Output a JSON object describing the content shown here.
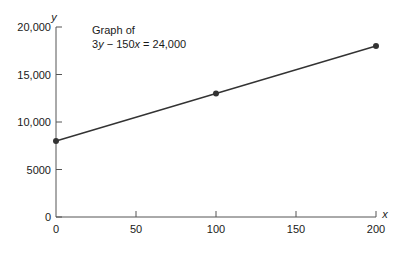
{
  "chart_data": {
    "type": "line",
    "title": "Graph of 3y − 150x = 24,000",
    "annotation": {
      "line1": "Graph of",
      "equation_parts": [
        "3",
        "y",
        " − 150",
        "x",
        " = 24,000"
      ]
    },
    "xlabel": "x",
    "ylabel": "y",
    "xlim": [
      0,
      200
    ],
    "ylim": [
      0,
      20000
    ],
    "x_ticks": [
      0,
      50,
      100,
      150,
      200
    ],
    "x_tick_labels": [
      "0",
      "50",
      "100",
      "150",
      "200"
    ],
    "y_ticks": [
      0,
      5000,
      10000,
      15000,
      20000
    ],
    "y_tick_labels": [
      "0",
      "5000",
      "10,000",
      "15,000",
      "20,000"
    ],
    "grid": false,
    "legend": null,
    "series": [
      {
        "name": "3y − 150x = 24,000",
        "x": [
          0,
          100,
          200
        ],
        "y": [
          8000,
          13000,
          18000
        ],
        "markers": true
      }
    ]
  },
  "colors": {
    "line": "#333333",
    "axis": "#555555",
    "text": "#1a1a1a"
  }
}
